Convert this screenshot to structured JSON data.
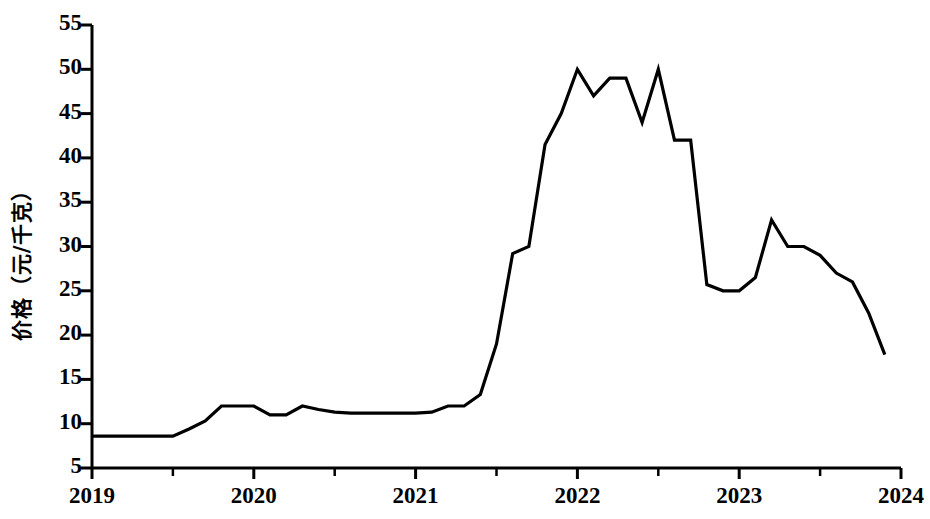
{
  "chart_data": {
    "type": "line",
    "title": "",
    "subtitle": "",
    "xlabel": "",
    "ylabel": "价格（元/千克）",
    "xlim": [
      2019,
      2024
    ],
    "ylim": [
      5,
      55
    ],
    "grid": false,
    "legend": null,
    "annotations": [],
    "line_color": "#000000",
    "y_ticks": [
      5,
      10,
      15,
      20,
      25,
      30,
      35,
      40,
      45,
      50,
      55
    ],
    "y_ticklabels": [
      "5",
      "10",
      "15",
      "20",
      "25",
      "30",
      "35",
      "40",
      "45",
      "50",
      "55"
    ],
    "x_ticks": [
      2019,
      2020,
      2021,
      2022,
      2023,
      2024
    ],
    "x_ticklabels": [
      "2019",
      "2020",
      "2021",
      "2022",
      "2023",
      "2024"
    ],
    "x_minor_ticks": [
      2019.5,
      2020.5,
      2021.5,
      2022.5,
      2023.5
    ],
    "series": [
      {
        "name": "价格",
        "x": [
          2019.0,
          2019.1,
          2019.2,
          2019.3,
          2019.4,
          2019.5,
          2019.6,
          2019.7,
          2019.8,
          2019.9,
          2020.0,
          2020.1,
          2020.2,
          2020.3,
          2020.4,
          2020.5,
          2020.6,
          2020.7,
          2020.8,
          2020.9,
          2021.0,
          2021.1,
          2021.2,
          2021.3,
          2021.4,
          2021.5,
          2021.6,
          2021.7,
          2021.8,
          2021.9,
          2022.0,
          2022.1,
          2022.2,
          2022.3,
          2022.4,
          2022.5,
          2022.6,
          2022.7,
          2022.8,
          2022.9,
          2023.0,
          2023.1,
          2023.2,
          2023.3,
          2023.4,
          2023.5,
          2023.6,
          2023.7,
          2023.8,
          2023.9
        ],
        "y": [
          8.6,
          8.6,
          8.6,
          8.6,
          8.6,
          8.6,
          9.4,
          10.3,
          12.0,
          12.0,
          12.0,
          11.0,
          11.0,
          12.0,
          11.6,
          11.3,
          11.2,
          11.2,
          11.2,
          11.2,
          11.2,
          11.3,
          12.0,
          12.0,
          13.3,
          19.0,
          29.2,
          30.0,
          41.5,
          45.0,
          50.0,
          47.0,
          49.0,
          49.0,
          44.0,
          50.0,
          42.0,
          42.0,
          25.7,
          25.0,
          25.0,
          26.5,
          33.0,
          30.0,
          30.0,
          29.0,
          27.0,
          26.0,
          22.5,
          17.8
        ]
      }
    ]
  },
  "axis": {
    "y_axis_label": "价格（元/千克）"
  }
}
